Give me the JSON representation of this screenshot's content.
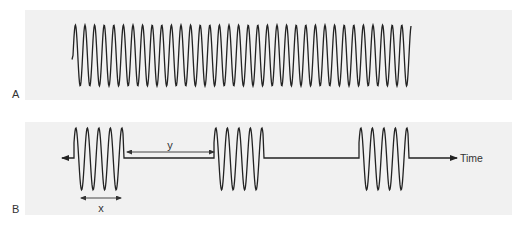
{
  "figure": {
    "panels": [
      {
        "label": "A",
        "description": "Continuous sinusoidal wave (continuous-wave signal)"
      },
      {
        "label": "B",
        "description": "Pulsed wave: repeated bursts of oscillation separated by quiet intervals",
        "annotations": {
          "pulse_duration_label": "x",
          "pulse_interval_label": "y",
          "axis_label": "Time"
        }
      }
    ],
    "colors": {
      "panel_background": "#f1f1f1",
      "line": "#222222",
      "text": "#333333"
    },
    "wave_a": {
      "x_start": 72,
      "x_end": 411,
      "period": 9.6,
      "top": 25,
      "bottom": 86
    },
    "wave_b": {
      "baseline": 158,
      "top": 128,
      "bottom": 190,
      "period": 11.5,
      "cycles_per_burst": 4,
      "bursts": [
        77,
        217,
        362
      ],
      "start_x": 62,
      "end_x": 457
    }
  }
}
